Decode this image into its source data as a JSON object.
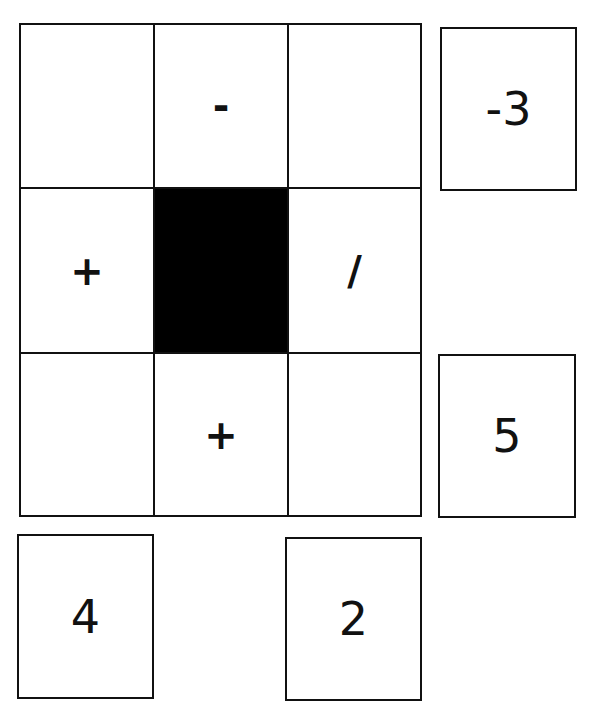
{
  "puzzle": {
    "grid": [
      [
        "",
        "-",
        ""
      ],
      [
        "+",
        "#BLACK",
        "/"
      ],
      [
        "",
        "+",
        ""
      ]
    ],
    "tiles": [
      {
        "label": "-3",
        "position": "right of row 1"
      },
      {
        "label": "5",
        "position": "right of row 3"
      },
      {
        "label": "4",
        "position": "below column 1"
      },
      {
        "label": "2",
        "position": "below column 3"
      }
    ],
    "colors": {
      "line": "#111111",
      "blocked": "#000000",
      "background": "#ffffff"
    }
  }
}
